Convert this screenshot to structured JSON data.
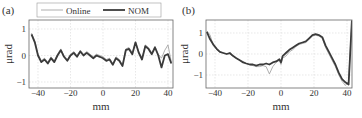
{
  "chart_data": [
    {
      "type": "line",
      "panel_label": "(a)",
      "xlabel": "mm",
      "ylabel": "μrad",
      "xlim": [
        -45,
        44
      ],
      "ylim": [
        -1.2,
        1.3
      ],
      "xticks": [
        "-40",
        "-20",
        "0",
        "20",
        "40"
      ],
      "yticks": [
        "1",
        "0",
        "-1"
      ],
      "grid": true,
      "legend": {
        "position": "top",
        "entries": [
          "Online",
          "NOM"
        ]
      },
      "series": [
        {
          "name": "Online",
          "color": "#9a9a9a",
          "width": 0.8,
          "x": [
            -44,
            -42,
            -40,
            -38,
            -36,
            -34,
            -32,
            -30,
            -28,
            -26,
            -24,
            -22,
            -20,
            -18,
            -16,
            -14,
            -12,
            -10,
            -8,
            -6,
            -4,
            -2,
            0,
            2,
            4,
            6,
            8,
            10,
            12,
            14,
            16,
            18,
            20,
            22,
            24,
            26,
            28,
            30,
            32,
            34,
            36,
            38,
            40,
            42
          ],
          "y": [
            0.85,
            0.55,
            0.05,
            -0.2,
            -0.1,
            -0.25,
            -0.05,
            -0.2,
            0.05,
            0.25,
            0.0,
            -0.15,
            0.05,
            0.15,
            0.0,
            0.2,
            0.05,
            0.15,
            0.05,
            -0.05,
            0.05,
            0.0,
            -0.05,
            -0.15,
            -0.1,
            -0.3,
            -0.05,
            -0.15,
            -0.35,
            0.25,
            0.3,
            0.1,
            0.5,
            0.15,
            -0.1,
            0.4,
            0.3,
            0.1,
            0.35,
            0.05,
            -0.1,
            0.2,
            0.4,
            -0.25
          ]
        },
        {
          "name": "NOM",
          "color": "#3a3a3a",
          "width": 1.8,
          "x": [
            -44,
            -42,
            -40,
            -38,
            -36,
            -34,
            -32,
            -30,
            -28,
            -26,
            -24,
            -22,
            -20,
            -18,
            -16,
            -14,
            -12,
            -10,
            -8,
            -6,
            -4,
            -2,
            0,
            2,
            4,
            6,
            8,
            10,
            12,
            14,
            16,
            18,
            20,
            22,
            24,
            26,
            28,
            30,
            32,
            34,
            36,
            38,
            40,
            42
          ],
          "y": [
            0.8,
            0.5,
            0.0,
            -0.25,
            -0.15,
            -0.3,
            -0.1,
            -0.25,
            0.0,
            0.2,
            -0.05,
            -0.2,
            0.0,
            0.1,
            -0.05,
            0.15,
            0.0,
            0.1,
            0.0,
            -0.1,
            0.0,
            -0.05,
            -0.1,
            -0.2,
            -0.15,
            -0.35,
            -0.1,
            -0.2,
            -0.4,
            0.2,
            0.25,
            0.05,
            0.5,
            0.1,
            -0.15,
            0.35,
            0.25,
            0.05,
            0.3,
            0.0,
            -0.45,
            0.0,
            0.05,
            -0.3
          ]
        }
      ]
    },
    {
      "type": "line",
      "panel_label": "(b)",
      "xlabel": "mm",
      "ylabel": "μrad",
      "xlim": [
        -45,
        44
      ],
      "ylim": [
        -1.5,
        1.5
      ],
      "xticks": [
        "-40",
        "-20",
        "0",
        "20",
        "40"
      ],
      "yticks": [
        "1",
        "0",
        "-1"
      ],
      "grid": true,
      "series": [
        {
          "name": "Online",
          "color": "#9a9a9a",
          "width": 0.8,
          "x": [
            -45,
            -43,
            -41,
            -39,
            -37,
            -35,
            -33,
            -31,
            -29,
            -27,
            -25,
            -23,
            -21,
            -19,
            -17,
            -15,
            -13,
            -11,
            -9,
            -7,
            -5,
            -3,
            -1,
            0,
            1,
            3,
            5,
            7,
            9,
            11,
            13,
            15,
            17,
            19,
            21,
            23,
            25,
            27,
            29,
            31,
            33,
            35,
            37,
            39,
            41,
            43
          ],
          "y": [
            1.1,
            0.9,
            0.4,
            0.2,
            0.1,
            0.05,
            0.0,
            0.0,
            -0.1,
            -0.2,
            -0.3,
            -0.35,
            -0.45,
            -0.5,
            -0.55,
            -0.6,
            -0.6,
            -0.55,
            -0.6,
            -0.95,
            -0.6,
            -0.4,
            -0.3,
            -0.5,
            -0.2,
            -0.1,
            0.1,
            0.2,
            0.35,
            0.45,
            0.5,
            0.55,
            0.7,
            0.85,
            0.9,
            0.85,
            0.75,
            0.3,
            0.0,
            -0.3,
            -0.6,
            -1.0,
            -1.3,
            -1.5,
            -1.3,
            1.6
          ]
        },
        {
          "name": "NOM",
          "color": "#3a3a3a",
          "width": 1.8,
          "x": [
            -45,
            -43,
            -41,
            -39,
            -37,
            -35,
            -33,
            -31,
            -29,
            -27,
            -25,
            -23,
            -21,
            -19,
            -17,
            -15,
            -13,
            -11,
            -9,
            -7,
            -5,
            -3,
            -1,
            0,
            1,
            3,
            5,
            7,
            9,
            11,
            13,
            15,
            17,
            19,
            21,
            23,
            25,
            27,
            29,
            31,
            33,
            35,
            37,
            39,
            41,
            43
          ],
          "y": [
            1.05,
            0.7,
            0.45,
            0.25,
            0.1,
            0.05,
            0.0,
            0.05,
            -0.1,
            -0.2,
            -0.3,
            -0.4,
            -0.45,
            -0.5,
            -0.5,
            -0.55,
            -0.5,
            -0.5,
            -0.45,
            -0.5,
            -0.4,
            -0.35,
            -0.25,
            -0.4,
            -0.1,
            0.05,
            0.2,
            0.3,
            0.4,
            0.5,
            0.55,
            0.6,
            0.75,
            0.9,
            0.95,
            0.9,
            0.8,
            0.4,
            0.1,
            -0.2,
            -0.5,
            -0.9,
            -1.2,
            -1.35,
            -1.45,
            1.6
          ]
        }
      ]
    }
  ]
}
